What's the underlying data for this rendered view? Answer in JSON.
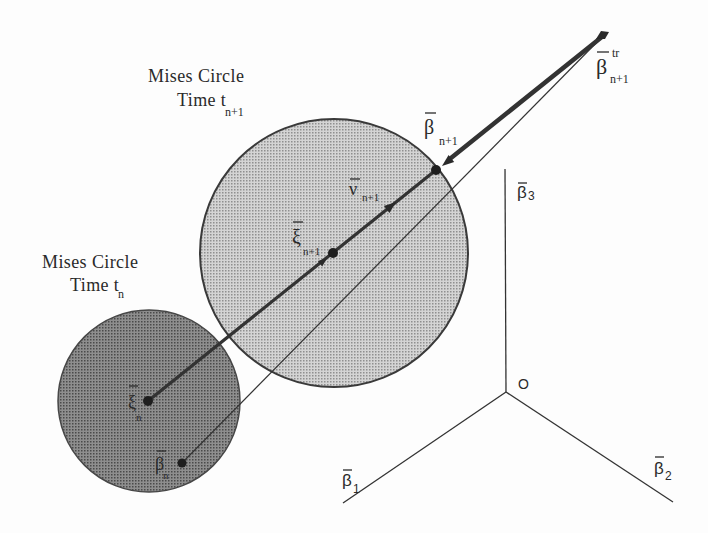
{
  "figure": {
    "width": 708,
    "height": 533,
    "colors": {
      "background": "#fdfdfd",
      "circle_next_fill": "#d4d4d4",
      "circle_next_stipple": "#8f8f8f",
      "circle_current_fill": "#8e8e8e",
      "circle_current_stipple": "#4a4a4a",
      "ink": "#2a2a2a"
    },
    "captions": {
      "circle_next": {
        "line1": "Mises Circle",
        "line2": "Time t",
        "line2_sub": "n+1"
      },
      "circle_current": {
        "line1": "Mises Circle",
        "line2": "Time t",
        "line2_sub": "n"
      }
    },
    "points": {
      "beta_trial": {
        "symbol": "β",
        "sup": "tr",
        "sub": "n+1"
      },
      "beta_next": {
        "symbol": "β",
        "sub": "n+1"
      },
      "nu_next": {
        "symbol": "ν",
        "sub": "n+1"
      },
      "xi_next": {
        "symbol": "ξ",
        "sub": "n+1"
      },
      "xi_current": {
        "symbol": "ξ",
        "sub": "n"
      },
      "beta_current": {
        "symbol": "β",
        "sub": "n"
      }
    },
    "axes": {
      "origin": "O",
      "beta1": {
        "symbol": "β",
        "sub": "1"
      },
      "beta2": {
        "symbol": "β",
        "sub": "2"
      },
      "beta3": {
        "symbol": "β",
        "sub": "3"
      }
    }
  }
}
